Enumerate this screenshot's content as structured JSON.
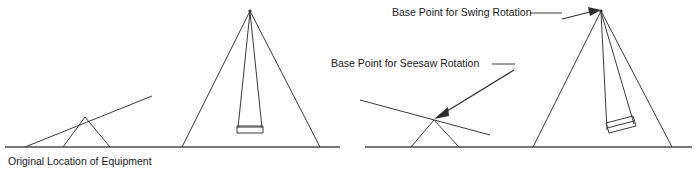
{
  "figure": {
    "type": "technical-line-diagram",
    "background_color": "#ffffff",
    "line_color": "#3a3a3a",
    "text_color": "#1a1a1a"
  },
  "labels": {
    "original_location": "Original Location of Equipment",
    "swing_base_point": "Base Point for Swing Rotation",
    "seesaw_base_point": "Base Point for Seesaw Rotation"
  },
  "scenes": [
    {
      "name": "original-position",
      "ground": {
        "x1": 5,
        "y1": 147,
        "x2": 340,
        "y2": 147
      },
      "equipment": [
        "seesaw-original",
        "swing-original"
      ]
    },
    {
      "name": "rotated-position",
      "ground": {
        "x1": 365,
        "y1": 147,
        "x2": 692,
        "y2": 147
      },
      "equipment": [
        "seesaw-rotated",
        "swing-rotated"
      ]
    }
  ],
  "geometry": {
    "seesaw_original": {
      "plank": {
        "x1": 25,
        "y1": 147,
        "x2": 152,
        "y2": 96
      },
      "pivot": {
        "x": 85,
        "y": 117
      },
      "leg_left": {
        "x": 63,
        "y": 147
      },
      "leg_right": {
        "x": 110,
        "y": 147
      }
    },
    "swing_original": {
      "apex": {
        "x": 250,
        "y": 11
      },
      "frame_left": {
        "x": 182,
        "y": 147
      },
      "frame_right": {
        "x": 320,
        "y": 147
      },
      "rope_left": {
        "x": 242,
        "y": 127
      },
      "rope_right": {
        "x": 258,
        "y": 127
      },
      "seat": {
        "x": 237,
        "y": 126,
        "w": 26,
        "h": 7
      }
    },
    "seesaw_rotated": {
      "plank": {
        "x1": 360,
        "y1": 100,
        "x2": 490,
        "y2": 135
      },
      "pivot": {
        "x": 434,
        "y": 120
      },
      "leg_left": {
        "x": 411,
        "y": 147
      },
      "leg_right": {
        "x": 459,
        "y": 147
      }
    },
    "swing_rotated": {
      "apex": {
        "x": 601,
        "y": 11
      },
      "frame_left": {
        "x": 533,
        "y": 147
      },
      "frame_right": {
        "x": 672,
        "y": 147
      },
      "rope_left": {
        "x": 607,
        "y": 124
      },
      "rope_right": {
        "x": 626,
        "y": 119
      },
      "seat": {
        "x": 608,
        "y": 122,
        "w": 27,
        "h": 8
      }
    }
  },
  "annotations": [
    {
      "name": "swing-rotation-callout",
      "text": "Base Point for Swing Rotation",
      "text_anchor": {
        "x": 392,
        "y": 16
      },
      "leader": {
        "x1": 530,
        "y1": 13,
        "x2": 560,
        "y2": 13
      },
      "arrow": {
        "x1": 560,
        "y1": 19,
        "x2": 599,
        "y2": 11
      }
    },
    {
      "name": "seesaw-rotation-callout",
      "text": "Base Point for Seesaw Rotation",
      "text_anchor": {
        "x": 331,
        "y": 67
      },
      "leader": {
        "x1": 492,
        "y1": 64,
        "x2": 513,
        "y2": 64
      },
      "arrow": {
        "x1": 513,
        "y1": 70,
        "x2": 437,
        "y2": 117
      }
    },
    {
      "name": "original-location-caption",
      "text": "Original Location of Equipment",
      "text_anchor": {
        "x": 8,
        "y": 165
      }
    }
  ]
}
